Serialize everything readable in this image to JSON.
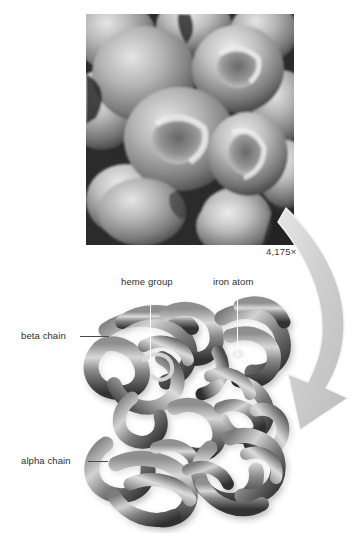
{
  "figure": {
    "background_color": "#ffffff"
  },
  "micrograph": {
    "name": "red-blood-cells-sem",
    "description": "Scanning electron micrograph of red blood cells",
    "magnification_label": "4,175×",
    "background_color": "#2a2a2a",
    "cell_color": "#a8a8a8"
  },
  "arrow": {
    "name": "zoom-in-arrow",
    "direction": "down-right-curving",
    "fill_color": "#d2d2d2",
    "edge_color": "#f2f2f2"
  },
  "protein": {
    "name": "hemoglobin-molecule",
    "description": "Hemoglobin quaternary structure with four folded polypeptide chains",
    "tube_color_dark": "#3c3c3c",
    "tube_color_light": "#d5d5d5"
  },
  "callouts": [
    {
      "id": "heme-group",
      "label": "heme group",
      "leader": "vertical-white"
    },
    {
      "id": "iron-atom",
      "label": "iron atom",
      "leader": "vertical-white"
    },
    {
      "id": "beta-chain",
      "label": "beta chain",
      "leader": "horizontal-dark"
    },
    {
      "id": "alpha-chain",
      "label": "alpha chain",
      "leader": "horizontal-dark"
    }
  ]
}
